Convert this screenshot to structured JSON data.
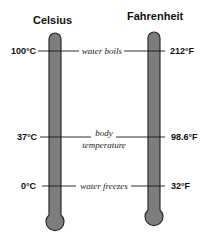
{
  "celsius": {
    "title": "Celsius",
    "labels": {
      "boil": "100°C",
      "body": "37°C",
      "freeze": "0°C"
    }
  },
  "fahrenheit": {
    "title": "Fahrenheit",
    "labels": {
      "boil": "212°F",
      "body": "98.6°F",
      "freeze": "32°F"
    }
  },
  "annotations": {
    "boil": "water boils",
    "body_line1": "body",
    "body_line2": "temperature",
    "freeze": "water freezes"
  },
  "colors": {
    "tube_fill": "#7d7d7d",
    "tube_outline": "#2a2a2a",
    "line": "#1a1a1a"
  }
}
